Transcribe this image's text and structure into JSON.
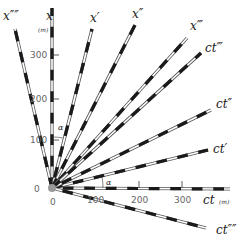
{
  "diagram": {
    "type": "spacetime-diagram",
    "origin": {
      "x": 52,
      "y": 188
    },
    "scale_px_per_100m": 43,
    "colors": {
      "line_dark": "#1a1a1a",
      "line_light": "#ffffff",
      "outline": "#555555",
      "origin_dot": "#999999",
      "text": "#222222",
      "tick_text": "#666666"
    },
    "axes": [
      {
        "id": "x",
        "label": "x",
        "end": [
          52,
          8
        ],
        "label_pos": [
          46,
          20
        ],
        "unit": "(m)",
        "unit_pos": [
          38,
          32
        ]
      },
      {
        "id": "x-prime",
        "label": "x′",
        "end": [
          92,
          29
        ],
        "label_pos": [
          90,
          22
        ]
      },
      {
        "id": "x-double-prime",
        "label": "x″",
        "end": [
          135,
          25
        ],
        "label_pos": [
          132,
          18
        ]
      },
      {
        "id": "x-triple-prime",
        "label": "x‴",
        "end": [
          187,
          38
        ],
        "label_pos": [
          190,
          30
        ]
      },
      {
        "id": "x-quad-prime",
        "label": "x″″",
        "end": [
          15,
          29
        ],
        "label_pos": [
          3,
          20
        ]
      },
      {
        "id": "ct",
        "label": "ct",
        "end": [
          230,
          189
        ],
        "label_pos": [
          203,
          204
        ],
        "unit": "(m)",
        "unit_pos": [
          219,
          204
        ]
      },
      {
        "id": "ct-prime",
        "label": "ct′",
        "end": [
          208,
          150
        ],
        "label_pos": [
          213,
          153
        ]
      },
      {
        "id": "ct-double-prime",
        "label": "ct″",
        "end": [
          211,
          110
        ],
        "label_pos": [
          216,
          108
        ]
      },
      {
        "id": "ct-triple-prime",
        "label": "ct‴",
        "end": [
          201,
          53
        ],
        "label_pos": [
          205,
          52
        ]
      },
      {
        "id": "ct-quad-prime",
        "label": "ct″″",
        "end": [
          206,
          228
        ],
        "label_pos": [
          216,
          234
        ]
      }
    ],
    "x_ticks": [
      {
        "label": "100",
        "y": 140
      },
      {
        "label": "200",
        "y": 99
      },
      {
        "label": "300",
        "y": 55
      }
    ],
    "ct_ticks": [
      {
        "label": "100",
        "x": 95
      },
      {
        "label": "200",
        "x": 139
      },
      {
        "label": "300",
        "x": 182
      }
    ],
    "origin_labels": {
      "x_zero": "0",
      "ct_zero": "0"
    },
    "angle_labels": [
      {
        "label": "α",
        "pos": [
          58,
          130
        ]
      },
      {
        "label": "α",
        "pos": [
          106,
          185
        ]
      }
    ]
  }
}
